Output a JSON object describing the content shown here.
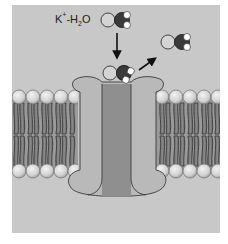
{
  "figure": {
    "title": "",
    "label": {
      "ion": "K",
      "charge": "+",
      "separator": "-H",
      "water_sub": "2",
      "water_tail": "O"
    },
    "colors": {
      "background": "#c8c8c8",
      "protein_outer": "#b9b9b9",
      "protein_pore": "#8f8f8f",
      "lipid_head": "#dcdcdc",
      "lipid_tail": "#5a5a5a",
      "ion": "#d4d4d4",
      "oxygen": "#3a3a3a",
      "hydrogen": "#ffffff",
      "arrow": "#111111"
    },
    "elements": [
      {
        "name": "k-ion-hydrated-incoming",
        "description": "K+ ion with water molecule above channel"
      },
      {
        "name": "k-ion-at-pore",
        "description": "K+ ion with water at channel mouth"
      },
      {
        "name": "k-ion-dehydrated-outgoing",
        "description": "Water molecule leaving the ion"
      },
      {
        "name": "arrow-down",
        "description": "Ion moving into channel"
      },
      {
        "name": "arrow-up-right",
        "description": "Water being stripped away"
      },
      {
        "name": "lipid-bilayer-left"
      },
      {
        "name": "lipid-bilayer-right"
      },
      {
        "name": "channel-protein"
      }
    ]
  }
}
